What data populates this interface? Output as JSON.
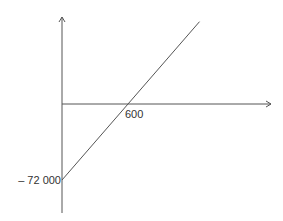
{
  "chart_data": {
    "type": "line",
    "title": "",
    "xlabel": "",
    "ylabel": "",
    "grid": false,
    "legend": "none",
    "xlim": [
      0,
      1250
    ],
    "ylim": [
      -130000,
      120000
    ],
    "series": [
      {
        "name": "profit",
        "x": [
          0,
          600,
          1250
        ],
        "y": [
          -72000,
          0,
          78000
        ]
      }
    ],
    "annotations": {
      "x_intercept_label": "600",
      "y_intercept_label": "– 72 000"
    }
  }
}
